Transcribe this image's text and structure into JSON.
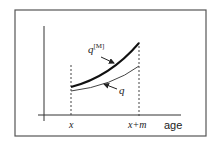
{
  "figure": {
    "type": "diagram",
    "x_axis_label": "age",
    "ticks": [
      {
        "label": "x"
      },
      {
        "label": "x+m"
      }
    ],
    "curves": [
      {
        "name": "q^[M]",
        "base": "q",
        "superscript": "[M]",
        "style": "thick"
      },
      {
        "name": "q",
        "base": "q",
        "style": "thin"
      }
    ]
  },
  "colors": {
    "line": "#222222",
    "frame": "#555555",
    "background": "#ffffff"
  }
}
